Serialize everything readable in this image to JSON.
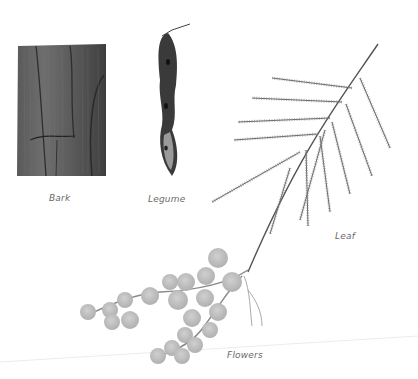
{
  "figure": {
    "labels": {
      "bark": "Bark",
      "legume": "Legume",
      "leaf": "Leaf",
      "flowers": "Flowers"
    },
    "colors": {
      "background": "#ffffff",
      "bark": "#4a4a4a",
      "legume": "#3a3a3a",
      "leaf": "#555555",
      "flowers": "#bdbdbd",
      "label": "#6a6a6a"
    }
  }
}
